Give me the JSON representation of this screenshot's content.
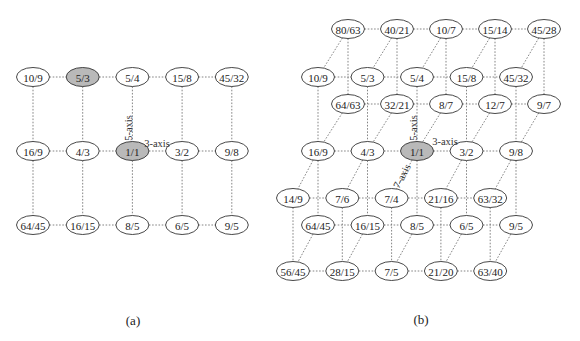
{
  "figure": {
    "panels": [
      {
        "id": "a",
        "caption": "(a)",
        "caption_pos": [
          133,
          320
        ],
        "axis_labels": [
          {
            "text": "5-axis",
            "x": 128,
            "y": 128,
            "rotate": -90
          },
          {
            "text": "3-axis",
            "x": 157,
            "y": 143,
            "rotate": 0
          }
        ],
        "layers": [
          {
            "name": "main",
            "rows": [
              {
                "y": 77,
                "x0": 33,
                "dx": 49.7,
                "labels": [
                  "10/9",
                  "5/3",
                  "5/4",
                  "15/8",
                  "45/32"
                ],
                "highlight": [
                  "5/3"
                ]
              },
              {
                "y": 151,
                "x0": 33,
                "dx": 49.7,
                "labels": [
                  "16/9",
                  "4/3",
                  "1/1",
                  "3/2",
                  "9/8"
                ],
                "highlight": [
                  "1/1"
                ]
              },
              {
                "y": 225,
                "x0": 33,
                "dx": 49.7,
                "labels": [
                  "64/45",
                  "16/15",
                  "8/5",
                  "6/5",
                  "9/5"
                ],
                "highlight": []
              }
            ]
          }
        ]
      },
      {
        "id": "b",
        "caption": "(b)",
        "caption_pos": [
          421,
          319
        ],
        "axis_labels": [
          {
            "text": "5-axis",
            "x": 413,
            "y": 128,
            "rotate": -90
          },
          {
            "text": "3-axis",
            "x": 445,
            "y": 141,
            "rotate": 0
          },
          {
            "text": "7-axis",
            "x": 402,
            "y": 176,
            "rotate": -62
          }
        ],
        "layers": [
          {
            "name": "divide-by-7",
            "rows": [
              {
                "y": 29,
                "x0": 348,
                "dx": 49,
                "labels": [
                  "80/63",
                  "40/21",
                  "10/7",
                  "15/14",
                  "45/28"
                ],
                "highlight": []
              },
              {
                "y": 104,
                "x0": 348,
                "dx": 49,
                "labels": [
                  "64/63",
                  "32/21",
                  "8/7",
                  "12/7",
                  "9/7"
                ],
                "highlight": []
              }
            ]
          },
          {
            "name": "main",
            "rows": [
              {
                "y": 77,
                "x0": 318,
                "dx": 49.5,
                "labels": [
                  "10/9",
                  "5/3",
                  "5/4",
                  "15/8",
                  "45/32"
                ],
                "highlight": []
              },
              {
                "y": 151,
                "x0": 318,
                "dx": 49.5,
                "labels": [
                  "16/9",
                  "4/3",
                  "1/1",
                  "3/2",
                  "9/8"
                ],
                "highlight": [
                  "1/1"
                ]
              },
              {
                "y": 225,
                "x0": 318,
                "dx": 49.5,
                "labels": [
                  "64/45",
                  "16/15",
                  "8/5",
                  "6/5",
                  "9/5"
                ],
                "highlight": []
              }
            ]
          },
          {
            "name": "times-7",
            "rows": [
              {
                "y": 198,
                "x0": 293,
                "dx": 49.3,
                "labels": [
                  "14/9",
                  "7/6",
                  "7/4",
                  "21/16",
                  "63/32"
                ],
                "highlight": []
              },
              {
                "y": 271,
                "x0": 293,
                "dx": 49.3,
                "labels": [
                  "56/45",
                  "28/15",
                  "7/5",
                  "21/20",
                  "63/40"
                ],
                "highlight": []
              }
            ]
          }
        ],
        "diagonals": [
          {
            "from_layer": 0,
            "from_row": 0,
            "to_layer": 1,
            "to_row": 0
          },
          {
            "from_layer": 0,
            "from_row": 1,
            "to_layer": 1,
            "to_row": 1
          },
          {
            "from_layer": 1,
            "from_row": 1,
            "to_layer": 2,
            "to_row": 0
          },
          {
            "from_layer": 1,
            "from_row": 2,
            "to_layer": 2,
            "to_row": 1
          }
        ]
      }
    ],
    "node_size": {
      "rx": 16.5,
      "ry": 9.5
    },
    "colors": {
      "highlight_fill": "#b9b9b9",
      "node_stroke": "#333333",
      "edge": "#777777"
    }
  }
}
